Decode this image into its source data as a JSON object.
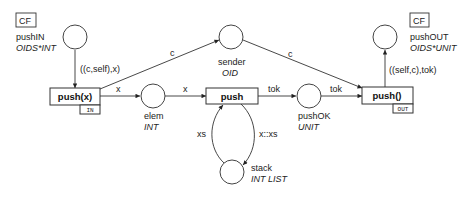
{
  "places": {
    "pushIN": {
      "name": "pushIN",
      "type": "OIDS*INT",
      "tag": "CF"
    },
    "sender": {
      "name": "sender",
      "type": "OID"
    },
    "elem": {
      "name": "elem",
      "type": "INT"
    },
    "pushOK": {
      "name": "pushOK",
      "type": "UNIT"
    },
    "stack": {
      "name": "stack",
      "type": "INT LIST"
    },
    "pushOUT": {
      "name": "pushOUT",
      "type": "OIDS*UNIT",
      "tag": "CF"
    }
  },
  "transitions": {
    "push_x": {
      "name": "push(x)",
      "tag": "IN"
    },
    "push": {
      "name": "push"
    },
    "push_out": {
      "name": "push()",
      "tag": "OUT"
    }
  },
  "arcs": {
    "pushIN_to_push_x": "((c,self),x)",
    "push_x_to_elem": "x",
    "push_x_to_sender": "c",
    "elem_to_push": "x",
    "push_to_pushOK": "tok",
    "stack_to_push": "xs",
    "push_to_stack": "x::xs",
    "pushOK_to_push_out": "tok",
    "sender_to_push_out": "c",
    "push_out_to_pushOUT": "((self,c),tok)"
  }
}
